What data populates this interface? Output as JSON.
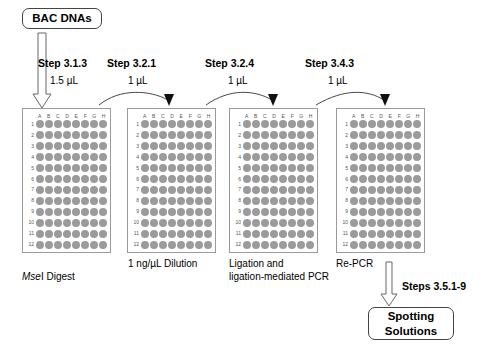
{
  "diagram": {
    "start_node": {
      "label": "BAC DNAs"
    },
    "end_node": {
      "label": "Spotting\nSolutions"
    },
    "final_step": {
      "label": "Steps 3.5.1-9"
    },
    "steps": [
      {
        "name": "Step 3.1.3",
        "volume": "1.5 µL"
      },
      {
        "name": "Step 3.2.1",
        "volume": "1 µL"
      },
      {
        "name": "Step 3.2.4",
        "volume": "1 µL"
      },
      {
        "name": "Step 3.4.3",
        "volume": "1 µL"
      }
    ],
    "plate_spec": {
      "columns": [
        "A",
        "B",
        "C",
        "D",
        "E",
        "F",
        "G",
        "H"
      ],
      "rows": [
        "1",
        "2",
        "3",
        "4",
        "5",
        "6",
        "7",
        "8",
        "9",
        "10",
        "11",
        "12"
      ],
      "well_count": 96,
      "well_color": "#9b9b9b",
      "border_color": "#9a9a9a"
    },
    "plates": [
      {
        "id": "plate-1",
        "caption": "MseI Digest",
        "caption_italic_prefix": "Mse",
        "caption_rest": "I Digest"
      },
      {
        "id": "plate-2",
        "caption": "1 ng/µL Dilution"
      },
      {
        "id": "plate-3",
        "caption": "Ligation and\nligation-mediated PCR"
      },
      {
        "id": "plate-4",
        "caption": "Re-PCR"
      }
    ],
    "colors": {
      "text": "#000000",
      "arrow_outline": "#555555",
      "arrow_curve": "#333333",
      "background": "#ffffff"
    }
  }
}
